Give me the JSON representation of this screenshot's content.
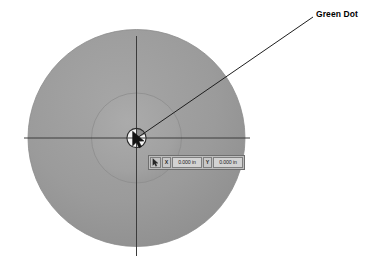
{
  "figure": {
    "background_color": "#ffffff",
    "outer_disc": {
      "name": "outer-disc",
      "center_x": 136.5,
      "center_y": 138,
      "radius": 108.5,
      "fill_color": "#9a9a9a",
      "stroke_color": "#8d8d8d"
    },
    "inner_disc": {
      "name": "inner-disc",
      "center_x": 136.5,
      "center_y": 138,
      "radius": 45,
      "fill_color": "#a3a3a3",
      "stroke_color": "#8e8e8e"
    },
    "green_dot": {
      "name": "green-dot",
      "center_x": 136.5,
      "center_y": 138,
      "radius": 10,
      "fill_color": "#f2f2f2",
      "stroke_color": "#2e2e2e"
    },
    "cursor": {
      "name": "arrow-cursor",
      "tip_x": 133,
      "tip_y": 133,
      "fill_color": "#1a1a1a"
    },
    "crosshair": {
      "name": "centerline-crosshair",
      "color": "#3c3c3c",
      "horizontal_x1": 24,
      "horizontal_x2": 250,
      "horizontal_y": 138,
      "vertical_x": 136.5,
      "vertical_y1": 36,
      "vertical_y2": 256
    },
    "leader_line": {
      "name": "callout-leader-line",
      "color": "#1e1e1e",
      "x1": 137,
      "y1": 138,
      "x2": 313,
      "y2": 17
    }
  },
  "callout": {
    "label": "Green Dot"
  },
  "coordinate_readout": {
    "cursor_icon": "mouse-pointer-icon",
    "x_axis_label": "X",
    "x_value": "0.000 in",
    "y_axis_label": "Y",
    "y_value": "0.000 in"
  }
}
